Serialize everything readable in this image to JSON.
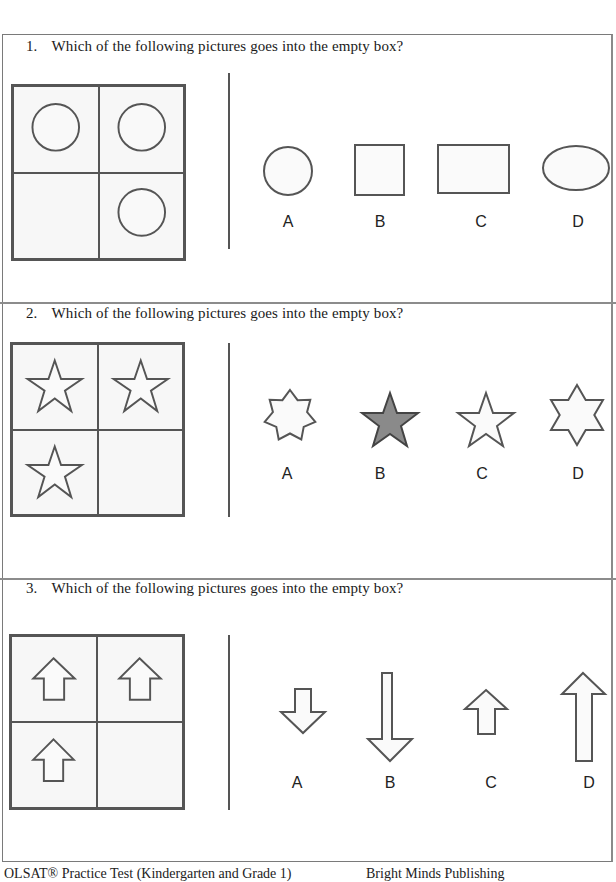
{
  "questions": [
    {
      "number": "1.",
      "prompt": "Which of the following pictures goes into the empty box?",
      "grid": {
        "cells": [
          "circle",
          "circle",
          "empty",
          "circle"
        ]
      },
      "options": [
        {
          "label": "A",
          "shape": "circle"
        },
        {
          "label": "B",
          "shape": "square"
        },
        {
          "label": "C",
          "shape": "rectangle"
        },
        {
          "label": "D",
          "shape": "ellipse"
        }
      ]
    },
    {
      "number": "2.",
      "prompt": "Which of the following pictures goes into the empty box?",
      "grid": {
        "cells": [
          "five-point-star",
          "five-point-star",
          "five-point-star",
          "empty"
        ]
      },
      "options": [
        {
          "label": "A",
          "shape": "seven-point-star"
        },
        {
          "label": "B",
          "shape": "five-point-star-gray"
        },
        {
          "label": "C",
          "shape": "five-point-star"
        },
        {
          "label": "D",
          "shape": "six-point-star"
        }
      ]
    },
    {
      "number": "3.",
      "prompt": "Which of the following pictures goes into the empty box?",
      "grid": {
        "cells": [
          "up-arrow",
          "up-arrow",
          "up-arrow",
          "empty"
        ]
      },
      "options": [
        {
          "label": "A",
          "shape": "short-down-arrow"
        },
        {
          "label": "B",
          "shape": "long-down-arrow"
        },
        {
          "label": "C",
          "shape": "short-up-arrow"
        },
        {
          "label": "D",
          "shape": "long-up-arrow"
        }
      ]
    }
  ],
  "footer": {
    "left": "OLSAT® Practice Test (Kindergarten and Grade 1)",
    "right": "Bright Minds Publishing"
  },
  "colors": {
    "stroke": "#555555",
    "gray_star_fill": "#8a8a8a",
    "cell_bg": "#f7f7f7"
  }
}
